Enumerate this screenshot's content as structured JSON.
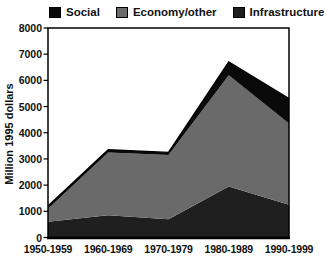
{
  "chart_data": {
    "type": "area",
    "stacked": true,
    "title": "",
    "xlabel": "",
    "ylabel": "Million 1995 dollars",
    "ylim": [
      0,
      8000
    ],
    "ytick_step": 1000,
    "grid": false,
    "legend_position": "top",
    "categories": [
      "1950-1959",
      "1960-1969",
      "1970-1979",
      "1980-1989",
      "1990-1999"
    ],
    "series": [
      {
        "name": "Infrastructure",
        "color": "#1f1f1f",
        "values": [
          600,
          850,
          700,
          1950,
          1250
        ]
      },
      {
        "name": "Economy/other",
        "color": "#6a6a6a",
        "values": [
          500,
          2400,
          2450,
          4250,
          3100
        ]
      },
      {
        "name": "Social",
        "color": "#0a0a0a",
        "values": [
          100,
          100,
          100,
          500,
          950
        ]
      }
    ],
    "legend_order": [
      "Social",
      "Economy/other",
      "Infrastructure"
    ],
    "stack_totals": [
      1200,
      3350,
      3250,
      6700,
      5300
    ]
  }
}
